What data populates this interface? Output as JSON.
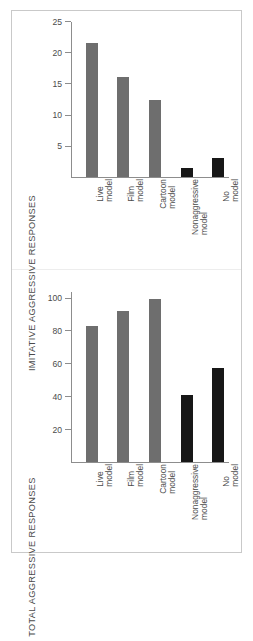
{
  "figure": {
    "background": "#ffffff",
    "frame_color": "#c9c9c9",
    "axis_color": "#8d8d8d",
    "bar_color_gray": "#6e6e6e",
    "bar_color_dark": "#171717"
  },
  "chart_data": [
    {
      "type": "bar",
      "title": "",
      "xlabel": "",
      "ylabel": "IMITATIVE AGGRESSIVE RESPONSES",
      "categories": [
        "Live model",
        "Film model",
        "Cartoon model",
        "Nonaggressive model",
        "No model"
      ],
      "category_lines": [
        [
          "Live",
          "model"
        ],
        [
          "Film",
          "model"
        ],
        [
          "Cartoon",
          "model"
        ],
        [
          "Nonaggressive",
          "model"
        ],
        [
          "No",
          "model"
        ]
      ],
      "values": [
        21.5,
        16.0,
        12.3,
        1.5,
        3.0
      ],
      "bar_colors": [
        "#6e6e6e",
        "#6e6e6e",
        "#6e6e6e",
        "#171717",
        "#171717"
      ],
      "ylim": [
        0,
        25
      ],
      "yticks": [
        5,
        10,
        15,
        20,
        25
      ],
      "ytick_labels": [
        "5",
        "10",
        "15",
        "20",
        "25"
      ],
      "grid": false,
      "legend": "none"
    },
    {
      "type": "bar",
      "title": "",
      "xlabel": "",
      "ylabel": "TOTAL AGGRESSIVE RESPONSES",
      "categories": [
        "Live model",
        "Film model",
        "Cartoon model",
        "Nonaggressive model",
        "No model"
      ],
      "category_lines": [
        [
          "Live",
          "model"
        ],
        [
          "Film",
          "model"
        ],
        [
          "Cartoon",
          "model"
        ],
        [
          "Nonaggressive",
          "model"
        ],
        [
          "No",
          "model"
        ]
      ],
      "values": [
        83,
        92,
        99,
        41,
        57
      ],
      "bar_colors": [
        "#6e6e6e",
        "#6e6e6e",
        "#6e6e6e",
        "#171717",
        "#171717"
      ],
      "ylim": [
        0,
        104
      ],
      "yticks": [
        20,
        40,
        60,
        80,
        100
      ],
      "ytick_labels": [
        "20",
        "40",
        "60",
        "80",
        "100"
      ],
      "grid": false,
      "legend": "none"
    }
  ]
}
